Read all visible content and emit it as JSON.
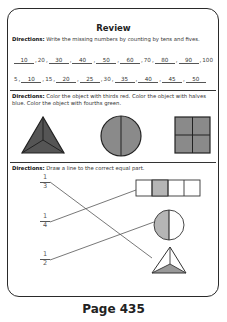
{
  "title": "Review",
  "section1": {
    "directions_label": "Directions:",
    "directions_text": "Write the missing numbers by counting by tens and fives.",
    "tens_row": [
      {
        "value": "10",
        "blank": true
      },
      {
        "value": "20",
        "blank": false
      },
      {
        "value": "30",
        "blank": true
      },
      {
        "value": "40",
        "blank": true
      },
      {
        "value": "50",
        "blank": true
      },
      {
        "value": "60",
        "blank": true
      },
      {
        "value": "70",
        "blank": false
      },
      {
        "value": "80",
        "blank": true
      },
      {
        "value": "90",
        "blank": true
      },
      {
        "value": "100",
        "blank": false
      }
    ],
    "fives_row": [
      {
        "value": "5",
        "blank": false
      },
      {
        "value": "10",
        "blank": true
      },
      {
        "value": "15",
        "blank": false
      },
      {
        "value": "20",
        "blank": true
      },
      {
        "value": "25",
        "blank": true
      },
      {
        "value": "30",
        "blank": false
      },
      {
        "value": "35",
        "blank": true
      },
      {
        "value": "40",
        "blank": true
      },
      {
        "value": "45",
        "blank": true
      },
      {
        "value": "50",
        "blank": true
      }
    ]
  },
  "section2": {
    "directions_label": "Directions:",
    "directions_text": "Color the object with thirds red. Color the object with halves blue. Color the object with fourths green.",
    "shapes": [
      {
        "name": "triangle-thirds",
        "parts": 3,
        "fill": "#555555"
      },
      {
        "name": "circle-halves",
        "parts": 2,
        "fill": "#8a8a8a"
      },
      {
        "name": "square-fourths",
        "parts": 4,
        "fill": "#8a8a8a"
      }
    ]
  },
  "section3": {
    "directions_label": "Directions:",
    "directions_text": "Draw a line to the correct equal part.",
    "fractions": [
      {
        "numerator": "1",
        "denominator": "3"
      },
      {
        "numerator": "1",
        "denominator": "4"
      },
      {
        "numerator": "1",
        "denominator": "2"
      }
    ],
    "shapes": [
      {
        "name": "bar-one-fourth-shaded",
        "parts": 4,
        "shaded": 1
      },
      {
        "name": "circle-one-half-shaded",
        "parts": 2,
        "shaded": 1
      },
      {
        "name": "triangle-one-third-shaded",
        "parts": 3,
        "shaded": 1
      }
    ],
    "matches": [
      {
        "from": "1/3",
        "to": "triangle"
      },
      {
        "from": "1/4",
        "to": "bar"
      },
      {
        "from": "1/2",
        "to": "circle"
      }
    ],
    "shade_color": "#b5b5b5"
  },
  "footer": {
    "page_label": "Page 435"
  }
}
